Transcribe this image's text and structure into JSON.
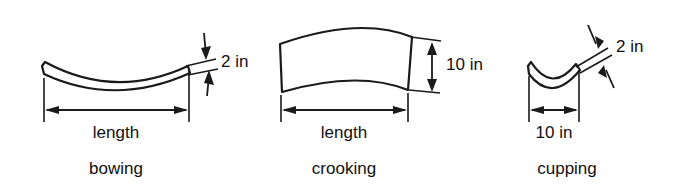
{
  "figure": {
    "background_color": "#ffffff",
    "line_color": "#1a1a1a",
    "text_color": "#111111"
  },
  "panels": [
    {
      "id": "bowing",
      "caption": "bowing",
      "length_label": "length",
      "deflection_label": "2 in",
      "shape": "long thin strip curved downward (bow along length, face view edge-on)"
    },
    {
      "id": "crooking",
      "caption": "crooking",
      "length_label": "length",
      "deflection_label": "10 in",
      "shape": "wide board curved along its edge (crook), viewed on face"
    },
    {
      "id": "cupping",
      "caption": "cupping",
      "width_label": "10 in",
      "deflection_label": "2 in",
      "shape": "short board cross-section curved concave-up (cup across width)"
    }
  ]
}
